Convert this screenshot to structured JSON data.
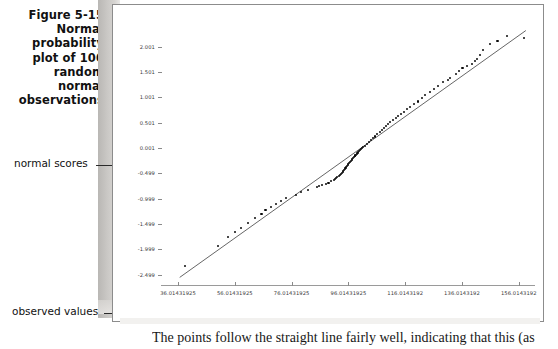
{
  "figure": {
    "caption_lines": [
      "Figure 5-15",
      "Normal",
      "probability",
      "plot of 100",
      "random",
      "normal",
      "observations"
    ],
    "annotations": {
      "y_axis_label": "normal scores",
      "x_axis_label": "observed values"
    }
  },
  "body_text": "The points follow the straight line fairly well, indicating that this (as",
  "icons": {
    "y_brace": "curly-brace-vertical",
    "x_brace": "curly-brace-horizontal"
  },
  "colors": {
    "point": "#0b0b0b",
    "fit_line": "#555555",
    "axis": "#9a9a9a",
    "sheet_border": "#8c8c8c",
    "shadow": "#b9b7b4"
  },
  "chart_data": {
    "type": "scatter",
    "xlabel": "observed values",
    "ylabel": "normal scores",
    "grid": false,
    "legend": "none",
    "xlim": [
      30.01431925,
      161.0143192
    ],
    "ylim": [
      -2.7,
      2.35
    ],
    "xtick_labels": [
      "36.01431925",
      "56.01431925",
      "76.01431925",
      "96.01431925",
      "116.0143192",
      "136.0143192",
      "156.0143192"
    ],
    "xticks": [
      36.01431925,
      56.01431925,
      76.01431925,
      96.01431925,
      116.0143192,
      136.0143192,
      156.0143192
    ],
    "ytick_labels": [
      "2.001",
      "1.501",
      "1.001",
      "0.501",
      "0.001",
      "-0.499",
      "-0.999",
      "-1.499",
      "-1.999",
      "-2.499"
    ],
    "yticks": [
      2.001,
      1.501,
      1.001,
      0.501,
      0.001,
      -0.499,
      -0.999,
      -1.499,
      -1.999,
      -2.499
    ],
    "fit_line": {
      "x": [
        36.6,
        158.5
      ],
      "y": [
        -2.55,
        2.32
      ]
    },
    "points": [
      {
        "x": 38.5,
        "y": -2.33
      },
      {
        "x": 50.0,
        "y": -1.93
      },
      {
        "x": 53.5,
        "y": -1.76
      },
      {
        "x": 56.0,
        "y": -1.66
      },
      {
        "x": 58.2,
        "y": -1.58
      },
      {
        "x": 60.6,
        "y": -1.47
      },
      {
        "x": 63.0,
        "y": -1.38
      },
      {
        "x": 65.4,
        "y": -1.3
      },
      {
        "x": 66.8,
        "y": -1.22
      },
      {
        "x": 68.6,
        "y": -1.16
      },
      {
        "x": 70.4,
        "y": -1.1
      },
      {
        "x": 72.4,
        "y": -1.04
      },
      {
        "x": 74.0,
        "y": -0.98
      },
      {
        "x": 77.6,
        "y": -0.92
      },
      {
        "x": 79.2,
        "y": -0.87
      },
      {
        "x": 81.8,
        "y": -0.82
      },
      {
        "x": 85.0,
        "y": -0.77
      },
      {
        "x": 86.8,
        "y": -0.72
      },
      {
        "x": 89.0,
        "y": -0.68
      },
      {
        "x": 91.0,
        "y": -0.63
      },
      {
        "x": 91.6,
        "y": -0.59
      },
      {
        "x": 92.6,
        "y": -0.55
      },
      {
        "x": 93.4,
        "y": -0.51
      },
      {
        "x": 94.0,
        "y": -0.47
      },
      {
        "x": 94.4,
        "y": -0.43
      },
      {
        "x": 95.0,
        "y": -0.39
      },
      {
        "x": 95.6,
        "y": -0.35
      },
      {
        "x": 96.0,
        "y": -0.31
      },
      {
        "x": 96.6,
        "y": -0.27
      },
      {
        "x": 97.2,
        "y": -0.24
      },
      {
        "x": 97.6,
        "y": -0.2
      },
      {
        "x": 98.2,
        "y": -0.16
      },
      {
        "x": 98.6,
        "y": -0.13
      },
      {
        "x": 99.2,
        "y": -0.09
      },
      {
        "x": 99.8,
        "y": -0.06
      },
      {
        "x": 100.4,
        "y": -0.02
      },
      {
        "x": 101.2,
        "y": 0.02
      },
      {
        "x": 101.8,
        "y": 0.05
      },
      {
        "x": 102.6,
        "y": 0.09
      },
      {
        "x": 103.4,
        "y": 0.12
      },
      {
        "x": 104.0,
        "y": 0.16
      },
      {
        "x": 104.6,
        "y": 0.2
      },
      {
        "x": 105.4,
        "y": 0.23
      },
      {
        "x": 106.2,
        "y": 0.27
      },
      {
        "x": 107.0,
        "y": 0.31
      },
      {
        "x": 107.8,
        "y": 0.35
      },
      {
        "x": 108.6,
        "y": 0.39
      },
      {
        "x": 109.2,
        "y": 0.43
      },
      {
        "x": 110.0,
        "y": 0.47
      },
      {
        "x": 110.8,
        "y": 0.51
      },
      {
        "x": 111.8,
        "y": 0.55
      },
      {
        "x": 112.8,
        "y": 0.59
      },
      {
        "x": 113.6,
        "y": 0.63
      },
      {
        "x": 114.6,
        "y": 0.68
      },
      {
        "x": 115.6,
        "y": 0.72
      },
      {
        "x": 116.6,
        "y": 0.77
      },
      {
        "x": 117.8,
        "y": 0.82
      },
      {
        "x": 119.0,
        "y": 0.87
      },
      {
        "x": 120.4,
        "y": 0.92
      },
      {
        "x": 121.8,
        "y": 0.98
      },
      {
        "x": 123.0,
        "y": 1.04
      },
      {
        "x": 124.6,
        "y": 1.1
      },
      {
        "x": 126.0,
        "y": 1.16
      },
      {
        "x": 127.6,
        "y": 1.22
      },
      {
        "x": 129.4,
        "y": 1.3
      },
      {
        "x": 131.8,
        "y": 1.38
      },
      {
        "x": 133.8,
        "y": 1.47
      },
      {
        "x": 136.2,
        "y": 1.58
      },
      {
        "x": 139.6,
        "y": 1.66
      },
      {
        "x": 141.4,
        "y": 1.76
      },
      {
        "x": 143.4,
        "y": 1.93
      },
      {
        "x": 146.0,
        "y": 2.05
      },
      {
        "x": 152.0,
        "y": 2.21
      },
      {
        "x": 157.8,
        "y": 2.18
      },
      {
        "x": 85.8,
        "y": -0.745
      },
      {
        "x": 88.0,
        "y": -0.7
      },
      {
        "x": 90.0,
        "y": -0.655
      },
      {
        "x": 91.3,
        "y": -0.61
      },
      {
        "x": 92.0,
        "y": -0.57
      },
      {
        "x": 93.0,
        "y": -0.53
      },
      {
        "x": 93.7,
        "y": -0.49
      },
      {
        "x": 94.2,
        "y": -0.45
      },
      {
        "x": 94.7,
        "y": -0.41
      },
      {
        "x": 95.3,
        "y": -0.37
      },
      {
        "x": 95.8,
        "y": -0.33
      },
      {
        "x": 96.3,
        "y": -0.29
      },
      {
        "x": 96.9,
        "y": -0.255
      },
      {
        "x": 97.4,
        "y": -0.22
      },
      {
        "x": 97.9,
        "y": -0.18
      },
      {
        "x": 98.4,
        "y": -0.145
      },
      {
        "x": 98.9,
        "y": -0.11
      },
      {
        "x": 99.5,
        "y": -0.075
      },
      {
        "x": 100.1,
        "y": -0.04
      },
      {
        "x": 100.8,
        "y": 0.0
      },
      {
        "x": 131.0,
        "y": 1.34
      },
      {
        "x": 134.8,
        "y": 1.52
      },
      {
        "x": 137.8,
        "y": 1.62
      },
      {
        "x": 140.5,
        "y": 1.71
      },
      {
        "x": 142.4,
        "y": 1.84
      },
      {
        "x": 148.5,
        "y": 2.12
      }
    ]
  }
}
